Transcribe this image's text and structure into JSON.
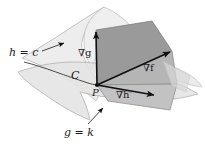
{
  "figure": {
    "type": "diagram",
    "width": 205,
    "height": 151,
    "background": "#ffffff"
  },
  "labels": {
    "surface_h": "h = c",
    "surface_g": "g = k",
    "curve": "C",
    "point": "P",
    "grad_g": "∇g",
    "grad_f": "∇f",
    "grad_h": "∇h"
  },
  "colors": {
    "ink": "#1a1a1a",
    "surface_h_fill": "#ededed",
    "surface_h_stroke": "#b9b9b9",
    "surface_g_fill": "#e4e4e4",
    "surface_g_stroke": "#b0b0b0",
    "plane_dark_fill": "#9a9a9a",
    "plane_mid_fill": "#b5b5b5",
    "plane_light_fill": "#c9c9c9",
    "plane_stroke": "#7d7d7d",
    "vector": "#111111"
  },
  "geometry": {
    "point_P": [
      97,
      85
    ],
    "grad_g_tip": [
      96,
      30
    ],
    "grad_f_tip": [
      172,
      51
    ],
    "grad_h_tip": [
      156,
      96
    ],
    "leader_h_from": [
      42,
      50
    ],
    "leader_h_to": [
      66,
      43
    ],
    "leader_g_from": [
      88,
      124
    ],
    "leader_g_to": [
      104,
      108
    ]
  }
}
